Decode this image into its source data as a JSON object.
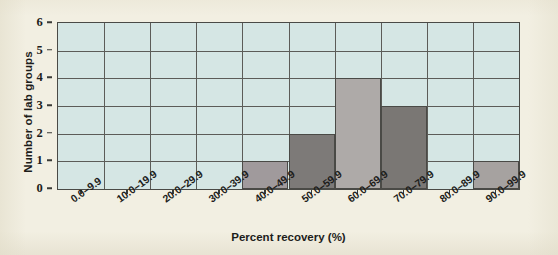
{
  "chart_data": {
    "type": "bar",
    "title": "",
    "xlabel": "Percent recovery (%)",
    "ylabel": "Number of lab groups",
    "categories": [
      "0.0–9.9",
      "10.0–19.9",
      "20.0–29.9",
      "30.0–39.9",
      "40.0–49.9",
      "50.0–59.9",
      "60.0–69.9",
      "70.0–79.9",
      "80.0–89.9",
      "90.0–99.9"
    ],
    "values": [
      0,
      0,
      0,
      0,
      1,
      2,
      4,
      3,
      0,
      1
    ],
    "bar_colors": [
      "",
      "",
      "",
      "",
      "#a09a9c",
      "#7d7a78",
      "#aeaaa8",
      "#7a7774",
      "",
      "#a6a2a0"
    ],
    "ylim": [
      0,
      6
    ],
    "ytick_labels": [
      "0",
      "1",
      "2",
      "3",
      "4",
      "5",
      "6"
    ],
    "ytick_values": [
      0,
      1,
      2,
      3,
      4,
      5,
      6
    ],
    "grid": true,
    "legend": "none",
    "plot_background": "#d5e6e4",
    "page_background": "#f2efe2",
    "axis_color": "#4a4a46",
    "grid_color": "#5c5c58"
  }
}
